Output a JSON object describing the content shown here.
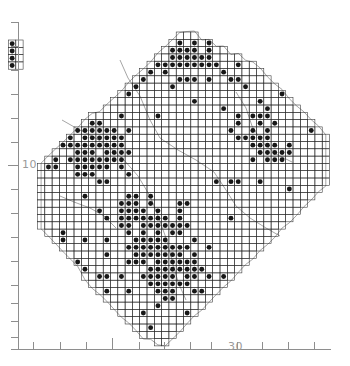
{
  "figure": {
    "type": "distribution-atlas-map"
  },
  "axes": {
    "y_axis": {
      "label": "10",
      "label_position_px": [
        22,
        158
      ],
      "tick_values": [
        2,
        3,
        4,
        5,
        6,
        7,
        8,
        9,
        10,
        11,
        12,
        13,
        14,
        15,
        16,
        17,
        18
      ],
      "major_tick_value": 10,
      "ticks_px": [
        22,
        46,
        70,
        94,
        118,
        142,
        165,
        189,
        213,
        237,
        261,
        285,
        303,
        321,
        337,
        349
      ],
      "major_ticks_px": [
        165
      ]
    },
    "x_axis": {
      "label": "30",
      "label_position_px": [
        228,
        340
      ],
      "tick_values": [
        24,
        25,
        26,
        27,
        28,
        29,
        30,
        31,
        32,
        33,
        34,
        35,
        36,
        37
      ],
      "major_tick_value": 28,
      "ticks_px": [
        33,
        60,
        86,
        112,
        139,
        164,
        190,
        211,
        237,
        262,
        288,
        314
      ],
      "major_ticks_px": [
        112
      ]
    },
    "frame_color": "#8e8e8e",
    "label_color": "#9a9a9a"
  },
  "map": {
    "grid_cell_size_px": 7.3,
    "grid_origin_px": [
      30.2,
      32.0
    ],
    "grid_color": "#2b2b2b",
    "outline_color": "#5a5a5a",
    "marker_color": "#171717",
    "marker_radius_px": 2.45,
    "marker_shape": "filled-circle",
    "occupied_cell_count": 614,
    "inset": {
      "name": "detached-outlier-inset",
      "cols": 2,
      "rows": 4,
      "origin_px": [
        8.5,
        40.0
      ],
      "occupied_cells": [
        [
          0,
          0
        ],
        [
          0,
          1
        ],
        [
          0,
          2
        ],
        [
          0,
          3
        ]
      ]
    },
    "grid_outline_path": "M 102,32 L 175,32 L 175,39 L 197,39 L 197,32 L 212,32 L 212,47 L 226,47 L 226,54 L 241,54 L 241,69 L 256,69 L 256,76 L 270,76 L 270,91 L 285,91 L 285,83 L 307,83 L 307,98 L 314,98 L 314,113 L 322,113 L 322,135 L 336,135 L 336,157 L 314,157 L 314,172 L 299,172 L 299,186 L 285,186 L 285,201 L 270,201 L 270,216 L 256,216 L 256,231 L 241,231 L 241,253 L 226,253 L 226,275 L 212,275 L 212,290 L 197,290 L 197,312 L 182,312 L 182,327 L 168,327 L 168,341 L 139,341 L 139,327 L 124,327 L 124,312 L 109,312 L 109,297 L 95,297 L 95,275 L 80,275 L 80,253 L 66,253 L 66,231 L 51,231 L 51,209 L 37,209 L 37,187 L 51,187 L 51,172 L 37,172 L 37,150 L 51,150 L 51,128 L 66,128 L 66,113 L 80,113 L 80,98 L 95,98 L 95,76 L 102,76 Z"
  },
  "colors": {
    "background": "#ffffff",
    "ink": "#171717",
    "grid": "#2b2b2b",
    "axis": "#8e8e8e",
    "label": "#9a9a9a"
  }
}
